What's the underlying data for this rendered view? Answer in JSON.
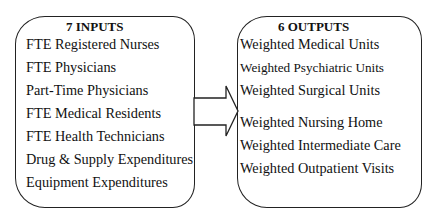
{
  "inputs": {
    "title": "7 INPUTS",
    "items": [
      "FTE Registered Nurses",
      "FTE Physicians",
      "Part-Time Physicians",
      "FTE Medical Residents",
      "FTE Health Technicians",
      "Drug & Supply Expenditures",
      "Equipment Expenditures"
    ]
  },
  "outputs": {
    "title": "6 OUTPUTS",
    "items": [
      "Weighted Medical Units",
      "Weighted Psychiatric Units",
      "Weighted Surgical Units",
      "Weighted Nursing Home",
      "Weighted Intermediate Care",
      "Weighted Outpatient Visits"
    ]
  },
  "arrow": {
    "direction": "right",
    "from": "inputs",
    "to": "outputs"
  }
}
